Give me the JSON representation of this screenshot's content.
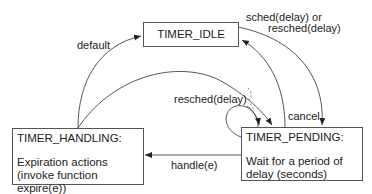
{
  "diagram": {
    "type": "state-machine",
    "states": [
      {
        "id": "idle",
        "title": "TIMER_IDLE",
        "description": ""
      },
      {
        "id": "pending",
        "title": "TIMER_PENDING:",
        "description_lines": [
          "Wait for a period of",
          "delay (seconds)"
        ]
      },
      {
        "id": "handling",
        "title": "TIMER_HANDLING:",
        "description_lines": [
          "Expiration actions",
          "(invoke function expire(e))"
        ]
      }
    ],
    "transitions": [
      {
        "from": "handling",
        "to": "idle",
        "label": "default"
      },
      {
        "from": "idle",
        "to": "pending",
        "label_lines": [
          "sched(delay) or",
          "resched(delay)"
        ]
      },
      {
        "from": "pending",
        "to": "idle",
        "label": "cancel"
      },
      {
        "from": "pending",
        "to": "pending",
        "label": "resched(delay)"
      },
      {
        "from": "handling",
        "to": "pending",
        "label": ""
      },
      {
        "from": "pending",
        "to": "handling",
        "label": "handle(e)"
      }
    ]
  },
  "labels": {
    "default": "default",
    "sched_line1": "sched(delay) or",
    "sched_line2": "resched(delay)",
    "cancel": "cancel",
    "resched": "resched(delay)",
    "handle": "handle(e)"
  },
  "colors": {
    "line": "#444444",
    "text": "#222222",
    "box_border": "#555555"
  }
}
